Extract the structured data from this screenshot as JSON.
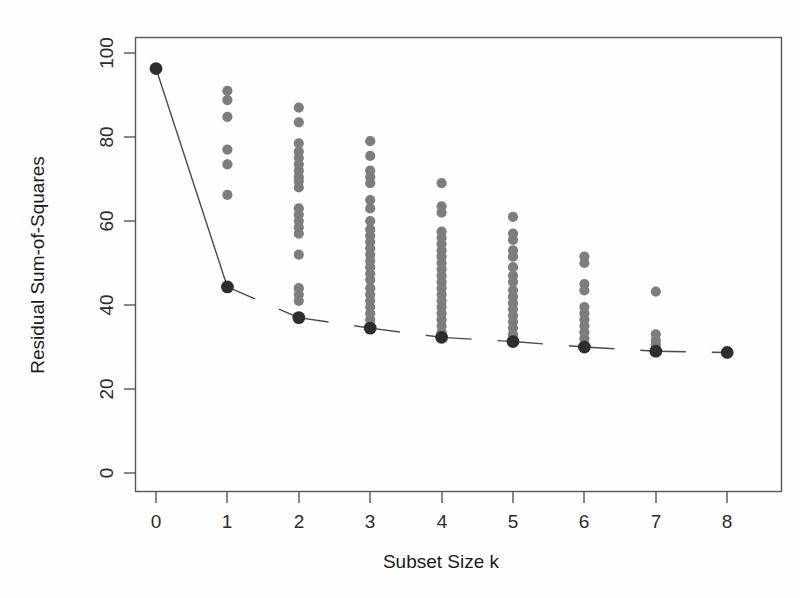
{
  "chart_data": {
    "type": "scatter",
    "title": "",
    "xlabel": "Subset Size k",
    "ylabel": "Residual Sum-of-Squares",
    "xlim": [
      -0.3,
      8.3
    ],
    "ylim": [
      -4,
      104
    ],
    "xticks": [
      0,
      1,
      2,
      3,
      4,
      5,
      6,
      7,
      8
    ],
    "xtick_labels": [
      "0",
      "1",
      "2",
      "3",
      "4",
      "5",
      "6",
      "7",
      "8"
    ],
    "yticks": [
      0,
      20,
      40,
      60,
      80,
      100
    ],
    "ytick_labels": [
      "0",
      "20",
      "40",
      "60",
      "80",
      "100"
    ],
    "grid": false,
    "legend": "none",
    "series": [
      {
        "name": "All subsets",
        "marker": "filled-circle",
        "color": "#7d7d7d",
        "points": [
          {
            "k": 0,
            "rss": [
              96.3
            ]
          },
          {
            "k": 1,
            "rss": [
              91.0,
              88.8,
              84.8,
              77.0,
              73.5,
              66.2
            ]
          },
          {
            "k": 2,
            "rss": [
              87.0,
              83.5,
              78.5,
              76.5,
              75.0,
              73.5,
              72.0,
              70.5,
              69.5,
              68.0,
              63.0,
              61.5,
              60.0,
              58.5,
              57.0,
              52.0,
              44.0,
              42.5,
              41.0,
              37.0
            ]
          },
          {
            "k": 3,
            "rss": [
              79.0,
              75.5,
              72.0,
              70.5,
              69.0,
              65.0,
              63.0,
              60.0,
              58.0,
              56.5,
              55.0,
              53.5,
              52.0,
              50.5,
              49.0,
              47.5,
              46.0,
              44.0,
              42.5,
              41.0,
              39.5,
              38.0,
              36.5,
              34.5
            ]
          },
          {
            "k": 4,
            "rss": [
              69.0,
              63.5,
              62.0,
              57.5,
              56.0,
              54.5,
              53.0,
              51.5,
              50.0,
              48.5,
              47.0,
              45.5,
              44.0,
              42.5,
              41.0,
              39.5,
              38.0,
              36.5,
              35.0,
              33.5,
              32.3
            ]
          },
          {
            "k": 5,
            "rss": [
              61.0,
              57.0,
              55.5,
              53.0,
              51.5,
              49.0,
              47.0,
              45.5,
              43.5,
              42.0,
              40.5,
              39.0,
              37.5,
              36.0,
              34.5,
              33.0,
              31.5
            ]
          },
          {
            "k": 6,
            "rss": [
              51.5,
              50.0,
              45.0,
              43.5,
              39.5,
              38.0,
              36.5,
              35.0,
              33.5,
              32.0,
              30.0
            ]
          },
          {
            "k": 7,
            "rss": [
              43.2,
              33.0,
              31.5,
              30.5,
              29.0
            ]
          },
          {
            "k": 8,
            "rss": [
              28.7
            ]
          }
        ]
      },
      {
        "name": "Best subset (minimum RSS)",
        "marker": "filled-circle-large",
        "color": "#2e2e2e",
        "line": "solid-then-dashed",
        "k": [
          0,
          1,
          2,
          3,
          4,
          5,
          6,
          7,
          8
        ],
        "rss": [
          96.3,
          44.3,
          37.0,
          34.5,
          32.3,
          31.3,
          30.0,
          29.0,
          28.7
        ]
      }
    ]
  },
  "axes": {
    "x_title": "Subset Size k",
    "y_title": "Residual Sum-of-Squares"
  },
  "colors": {
    "gray_points": "#7d7d7d",
    "black_points": "#2e2e2e",
    "frame": "#555555",
    "background": "#fefefe"
  }
}
